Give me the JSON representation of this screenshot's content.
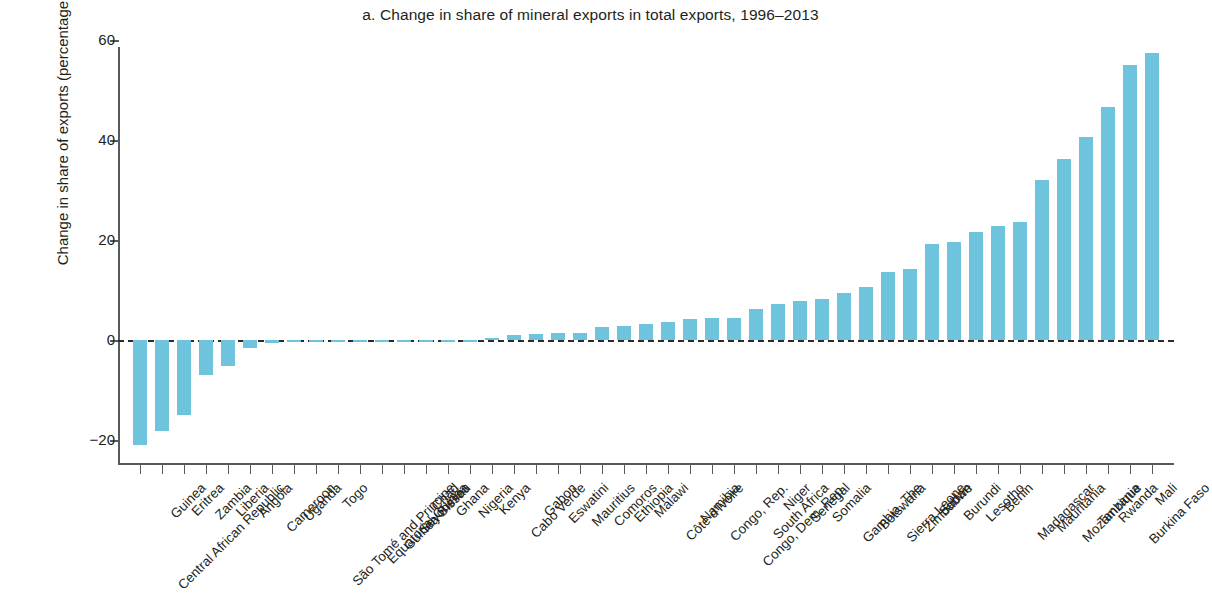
{
  "chart_data": {
    "type": "bar",
    "title": "a. Change in share of mineral exports in total exports, 1996–2013",
    "xlabel": "",
    "ylabel": "Change in share of exports (percentage points)",
    "ylim": [
      -25,
      60
    ],
    "yticks": [
      -20,
      0,
      20,
      40,
      60
    ],
    "ytick_labels": [
      "−20",
      "0",
      "20",
      "40",
      "60"
    ],
    "grid": false,
    "legend": null,
    "bar_color": "#6ec4dd",
    "zero_line": true,
    "categories": [
      "Central African Republic",
      "Guinea",
      "Eritrea",
      "Zambia",
      "Liberia",
      "Angola",
      "Cameroon",
      "Uganda",
      "São Tomé and Principe",
      "Togo",
      "Equatorial Guinea",
      "Guinea-Bissau",
      "Seychelles",
      "Chad",
      "Ghana",
      "Nigeria",
      "Kenya",
      "Cabo Verde",
      "Gabon",
      "Eswatini",
      "Mauritius",
      "Comoros",
      "Ethiopia",
      "Malawi",
      "Côte d'Ivoire",
      "Namibia",
      "Congo, Rep.",
      "Congo, Dem. Rep.",
      "South Africa",
      "Niger",
      "Senegal",
      "Somalia",
      "Gambia, The",
      "Botswana",
      "Sierra Leone",
      "Zimbabwe",
      "Sudan",
      "Burundi",
      "Lesotho",
      "Benin",
      "Madagascar",
      "Mauritania",
      "Mozambique",
      "Tanzania",
      "Rwanda",
      "Burkina Faso",
      "Mali"
    ],
    "values": [
      -21.0,
      -18.2,
      -15.0,
      -7.0,
      -5.2,
      -1.6,
      -0.6,
      -0.3,
      -0.2,
      -0.2,
      -0.2,
      -0.2,
      -0.2,
      -0.2,
      -0.3,
      -0.4,
      0.5,
      1.1,
      1.2,
      1.4,
      1.5,
      2.7,
      2.9,
      3.2,
      3.6,
      4.3,
      4.4,
      4.5,
      6.3,
      7.3,
      7.8,
      8.2,
      9.5,
      10.7,
      13.7,
      14.2,
      19.3,
      19.6,
      21.7,
      22.8,
      23.6,
      32.1,
      36.3,
      40.6,
      46.6,
      55.0,
      57.5
    ]
  }
}
